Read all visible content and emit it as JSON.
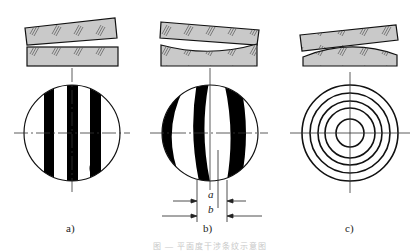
{
  "figure": {
    "panels": [
      {
        "id": "a",
        "label": "a)",
        "description": "Straight parallel interference fringes from a wedge of two flat glass plates"
      },
      {
        "id": "b",
        "label": "b)",
        "description": "Curved fringes from a flat plate over a slightly concave surface",
        "dimensions": {
          "a": "a",
          "b": "b"
        }
      },
      {
        "id": "c",
        "label": "c)",
        "description": "Concentric ring fringes from a flat plate over a convex surface"
      }
    ],
    "caption": "图 — 平面度干涉条纹示意图",
    "colors": {
      "plate_fill": "#c9c9c9",
      "stroke": "#111111",
      "fringe": "#000000",
      "centerline": "#333333"
    }
  }
}
